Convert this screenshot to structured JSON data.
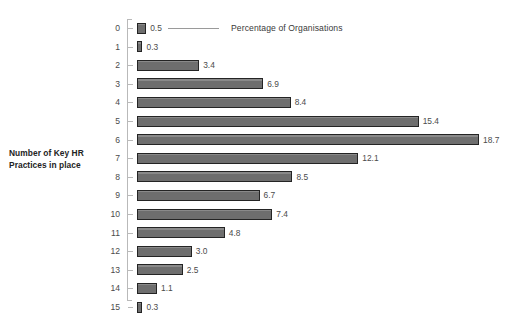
{
  "chart_data": {
    "type": "bar",
    "orientation": "horizontal",
    "title": "",
    "xlabel": "",
    "ylabel": "Number of Key HR Practices in place",
    "legend": {
      "label": "Percentage of Organisations",
      "position": "top-right-leader-line"
    },
    "grid": false,
    "xlim": [
      0,
      20
    ],
    "categories": [
      "0",
      "1",
      "2",
      "3",
      "4",
      "5",
      "6",
      "7",
      "8",
      "9",
      "10",
      "11",
      "12",
      "13",
      "14",
      "15"
    ],
    "values": [
      0.5,
      0.3,
      3.4,
      6.9,
      8.4,
      15.4,
      18.7,
      12.1,
      8.5,
      6.7,
      7.4,
      4.8,
      3.0,
      2.5,
      1.1,
      0.3
    ],
    "value_labels": [
      "0.5",
      "0.3",
      "3.4",
      "6.9",
      "8.4",
      "15.4",
      "18.7",
      "12.1",
      "8.5",
      "6.7",
      "7.4",
      "4.8",
      "3.0",
      "2.5",
      "1.1",
      "0.3"
    ],
    "series": [
      {
        "name": "Percentage of Organisations",
        "values": [
          0.5,
          0.3,
          3.4,
          6.9,
          8.4,
          15.4,
          18.7,
          12.1,
          8.5,
          6.7,
          7.4,
          4.8,
          3.0,
          2.5,
          1.1,
          0.3
        ]
      }
    ],
    "colors": {
      "bar_fill": "#6e6e6e",
      "bar_border": "#242424",
      "axis": "#b9b9b9",
      "text": "#3a3a3a",
      "background": "#ffffff"
    }
  },
  "title_sliver": {
    "text": ""
  },
  "axis": {
    "y_title_line1": "Number of Key HR",
    "y_title_line2": "Practices in place"
  }
}
